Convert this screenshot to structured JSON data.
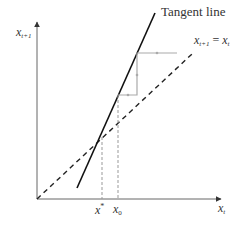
{
  "diagram": {
    "type": "cobweb",
    "axes": {
      "y_label": {
        "base": "x",
        "sub": "t+1"
      },
      "x_label": {
        "base": "x",
        "sub": "t"
      }
    },
    "curves": {
      "tangent_label": "Tangent line",
      "diagonal_label": {
        "lhs_base": "x",
        "lhs_sub": "t+1",
        "eq": " = ",
        "rhs_base": "x",
        "rhs_sub": "t"
      }
    },
    "ticks": {
      "fixed_point": {
        "base": "x",
        "sup": "*"
      },
      "initial": {
        "base": "x",
        "sub": "0"
      }
    },
    "colors": {
      "axis": "#555555",
      "tangent": "#111111",
      "diagonal": "#222222",
      "cobweb": "#aaaaaa",
      "guide": "#999999"
    }
  }
}
